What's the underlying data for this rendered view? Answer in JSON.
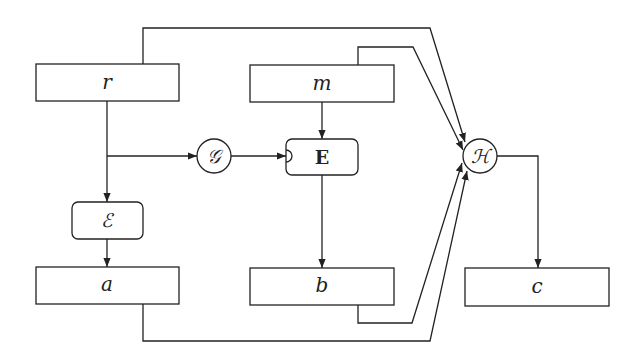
{
  "diagram": {
    "nodes": {
      "r": {
        "label": "r",
        "shape": "rectangle"
      },
      "m": {
        "label": "m",
        "shape": "rectangle"
      },
      "G": {
        "label": "𝒢",
        "shape": "circle"
      },
      "E": {
        "label": "E",
        "shape": "rounded-rectangle",
        "style": "bold"
      },
      "H": {
        "label": "ℋ",
        "shape": "circle"
      },
      "Enc": {
        "label": "ℰ",
        "shape": "rounded-rectangle"
      },
      "a": {
        "label": "a",
        "shape": "rectangle"
      },
      "b": {
        "label": "b",
        "shape": "rectangle"
      },
      "c": {
        "label": "c",
        "shape": "rectangle"
      }
    },
    "edges": [
      {
        "from": "r",
        "to": "Enc"
      },
      {
        "from": "r",
        "to": "G"
      },
      {
        "from": "r",
        "to": "H"
      },
      {
        "from": "G",
        "to": "E"
      },
      {
        "from": "m",
        "to": "E"
      },
      {
        "from": "m",
        "to": "H"
      },
      {
        "from": "Enc",
        "to": "a"
      },
      {
        "from": "E",
        "to": "b"
      },
      {
        "from": "a",
        "to": "H"
      },
      {
        "from": "b",
        "to": "H"
      },
      {
        "from": "H",
        "to": "c"
      }
    ],
    "colors": {
      "stroke": "#222222",
      "background": "#ffffff"
    }
  }
}
